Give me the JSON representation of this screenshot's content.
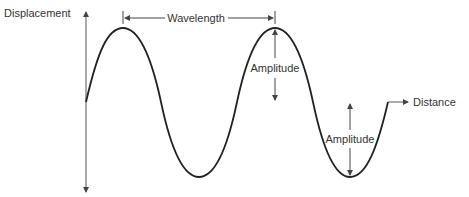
{
  "diagram": {
    "type": "transverse wave",
    "labels": {
      "y_axis": "Displacement",
      "x_axis": "Distance",
      "wavelength": "Wavelength",
      "amplitude_top": "Amplitude",
      "amplitude_bottom": "Amplitude"
    },
    "colors": {
      "wave": "#222222",
      "axes": "#555555",
      "text": "#333333",
      "baseline_tint_red": "#c0392b",
      "baseline_tint_green": "#4caf50"
    }
  }
}
